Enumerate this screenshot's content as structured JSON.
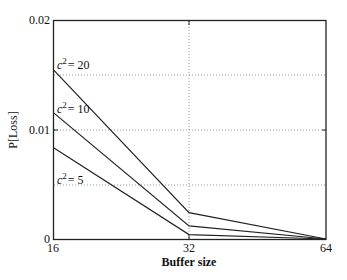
{
  "chart_data": {
    "type": "line",
    "title": "",
    "xlabel": "Buffer size",
    "ylabel": "P[Loss]",
    "x": [
      16,
      32,
      64
    ],
    "xticks": [
      "16",
      "32",
      "64"
    ],
    "yticks": [
      "0",
      "0.01",
      "0.02"
    ],
    "ylim": [
      0,
      0.02
    ],
    "grid": true,
    "legend": "inline annotations",
    "series": [
      {
        "name": "c^2 = 20",
        "label_base": "c",
        "label_exp": "2",
        "label_val": "= 20",
        "values": [
          0.0154,
          0.0024,
          0.0
        ]
      },
      {
        "name": "c^2 = 10",
        "label_base": "c",
        "label_exp": "2",
        "label_val": "= 10",
        "values": [
          0.0115,
          0.0012,
          0.0
        ]
      },
      {
        "name": "c^2 = 5",
        "label_base": "c",
        "label_exp": "2",
        "label_val": "= 5",
        "values": [
          0.0083,
          0.0004,
          0.0
        ]
      }
    ]
  }
}
